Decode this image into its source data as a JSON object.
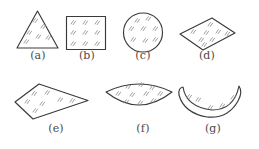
{
  "figure": {
    "title": "",
    "background_color": "#ffffff",
    "outline_color": "#3a3a3a",
    "hatch_color": "#7d7d85",
    "caption_color": "#4a4a4a",
    "width": 259,
    "height": 149,
    "panels": [
      {
        "id": "a",
        "label": "(a)",
        "shape_name": "triangle",
        "label_x": 38,
        "label_y": 55,
        "row": 1
      },
      {
        "id": "b",
        "label": "(b)",
        "shape_name": "square",
        "label_x": 87,
        "label_y": 55,
        "row": 1
      },
      {
        "id": "c",
        "label": "(c)",
        "shape_name": "circle",
        "label_x": 143,
        "label_y": 55,
        "row": 1
      },
      {
        "id": "d",
        "label": "(d)",
        "shape_name": "rhombus",
        "label_x": 207,
        "label_y": 55,
        "row": 1
      },
      {
        "id": "e",
        "label": "(e)",
        "shape_name": "irregular-quadrilateral",
        "label_x": 56,
        "label_y": 128,
        "row": 2
      },
      {
        "id": "f",
        "label": "(f)",
        "shape_name": "curved-fan",
        "label_x": 143,
        "label_y": 128,
        "row": 2
      },
      {
        "id": "g",
        "label": "(g)",
        "shape_name": "crescent-banana",
        "label_x": 213,
        "label_y": 128,
        "row": 2
      }
    ]
  }
}
